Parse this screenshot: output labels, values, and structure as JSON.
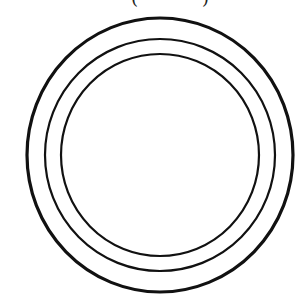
{
  "figure": {
    "top_caption_fragments": [
      "(",
      ")"
    ],
    "stroke_color": "#111111",
    "background_color": "#ffffff",
    "center": {
      "x": 160,
      "y": 155
    },
    "rings": [
      {
        "name": "outer",
        "rx": 133,
        "ry": 137,
        "stroke_width": 3.2
      },
      {
        "name": "middle",
        "rx": 115,
        "ry": 116,
        "stroke_width": 2.2
      },
      {
        "name": "inner",
        "rx": 99,
        "ry": 101,
        "stroke_width": 2.2
      }
    ]
  }
}
